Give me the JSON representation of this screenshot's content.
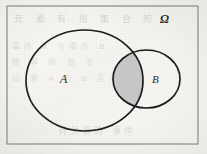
{
  "figure": {
    "kind": "venn-diagram",
    "background_color": "#f7f6f4"
  },
  "universe": {
    "label": "Ω",
    "name": "universal-set",
    "border_color": "#6a6a6a",
    "border_width_px": 1,
    "rect": {
      "x": 7,
      "y": 6,
      "width": 191,
      "height": 138
    }
  },
  "sets": [
    {
      "id": "A",
      "label": "A",
      "shape": "ellipse",
      "cx": 84.5,
      "cy": 80.5,
      "rx": 58.5,
      "ry": 50.5,
      "stroke": "#1c1c1c",
      "stroke_width_px": 1.7,
      "fill": "none",
      "label_x": 66,
      "label_y": 80
    },
    {
      "id": "B",
      "label": "B",
      "shape": "ellipse",
      "cx": 146.5,
      "cy": 79.0,
      "rx": 33.5,
      "ry": 29.0,
      "stroke": "#1c1c1c",
      "stroke_width_px": 1.7,
      "fill": "none",
      "label_x": 156,
      "label_y": 80
    }
  ],
  "shaded_region": {
    "name": "A-intersect-B",
    "notation": "A ∩ B",
    "fill": "#c6c6c6",
    "fill_opacity": 1,
    "stroke": "#1c1c1c",
    "stroke_width_px": 1.7
  },
  "ghost_text": {
    "top": "元 素 有 限 集 合 的",
    "row2": "事件 A 与事件 B",
    "row3": "概 率 的 加 法",
    "row4": "如 果 A 与 B 互斥",
    "bottom": "有关系的 事件"
  },
  "colors": {
    "ink": "#1c1c1c",
    "frame": "#6a6a6a",
    "shade": "#c6c6c6",
    "paper": "#f7f6f4",
    "ghost": "#b9b5b0"
  }
}
